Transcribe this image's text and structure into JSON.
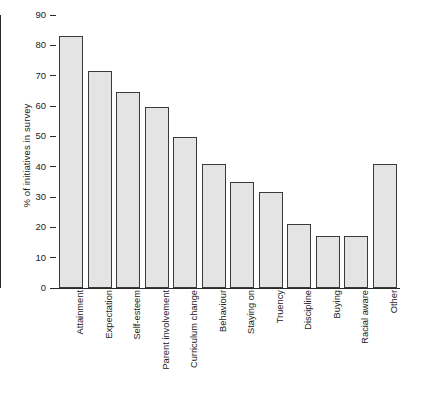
{
  "chart_data": {
    "type": "bar",
    "title": "",
    "subtitle": "",
    "xlabel": "",
    "ylabel": "% of initiatives in survey",
    "ylim": [
      0,
      90
    ],
    "yticks": [
      0,
      10,
      20,
      30,
      40,
      50,
      60,
      70,
      80,
      90
    ],
    "grid": false,
    "legend": null,
    "categories": [
      "Attainment",
      "Expectation",
      "Self-esteem",
      "Parent involvement",
      "Curriculum change",
      "Behaviour",
      "Staying on",
      "Truency",
      "Discipline",
      "Buying",
      "Racial aware",
      "Other"
    ],
    "values": [
      83,
      71.5,
      64.5,
      59.8,
      49.7,
      41,
      34.8,
      31.5,
      21,
      17,
      17,
      41
    ],
    "bar_fill_color": "#e4e4e4",
    "bar_edge_color": "#3a3a3a",
    "axis_color": "#2a2a2a"
  }
}
